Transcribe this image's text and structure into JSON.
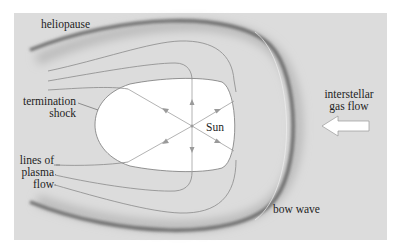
{
  "diagram": {
    "labels": {
      "heliopause": "heliopause",
      "termination_shock_line1": "termination",
      "termination_shock_line2": "shock",
      "sun": "Sun",
      "interstellar_line1": "interstellar",
      "interstellar_line2": "gas flow",
      "plasma_line1": "lines of",
      "plasma_line2": "plasma",
      "plasma_line3": "flow",
      "bow_wave": "bow wave"
    },
    "colors": {
      "background_panel": "#dcdcdc",
      "heliopause_stroke": "#6a6a6a",
      "termination_shock_fill": "#ffffff",
      "flow_line": "#8a8a8a",
      "ray_line": "#a0a0a0",
      "text": "#1e1e1e"
    },
    "sun_position": [
      192,
      126
    ]
  }
}
